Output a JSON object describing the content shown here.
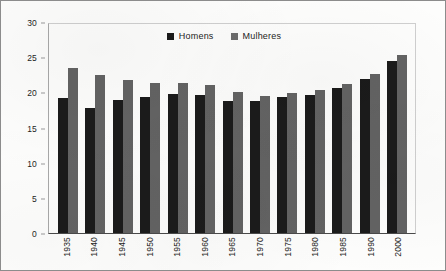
{
  "chart_data": {
    "type": "bar",
    "title": "",
    "subtitle": "",
    "xlabel": "",
    "ylabel": "",
    "ylim": [
      0,
      30
    ],
    "ytick_labels": [
      "30",
      "25",
      "20",
      "15",
      "10",
      "5",
      "0"
    ],
    "ytick_values": [
      30,
      25,
      20,
      15,
      10,
      5,
      0
    ],
    "grid": false,
    "legend_position": "top-center",
    "categories": [
      "1935",
      "1940",
      "1945",
      "1950",
      "1955",
      "1960",
      "1965",
      "1970",
      "1975",
      "1980",
      "1985",
      "1990",
      "2000"
    ],
    "series": [
      {
        "name": "Homens",
        "color": "#1b1b1b",
        "values": [
          19.2,
          17.8,
          18.9,
          19.3,
          19.7,
          19.6,
          18.8,
          18.7,
          19.3,
          19.6,
          20.6,
          21.9,
          24.5
        ]
      },
      {
        "name": "Mulheres",
        "color": "#636363",
        "values": [
          23.4,
          22.4,
          21.7,
          21.4,
          21.4,
          21.1,
          20.1,
          19.5,
          19.9,
          20.4,
          21.2,
          22.6,
          25.3
        ]
      }
    ]
  },
  "legend": {
    "items": [
      {
        "label": "Homens"
      },
      {
        "label": "Mulheres"
      }
    ]
  }
}
